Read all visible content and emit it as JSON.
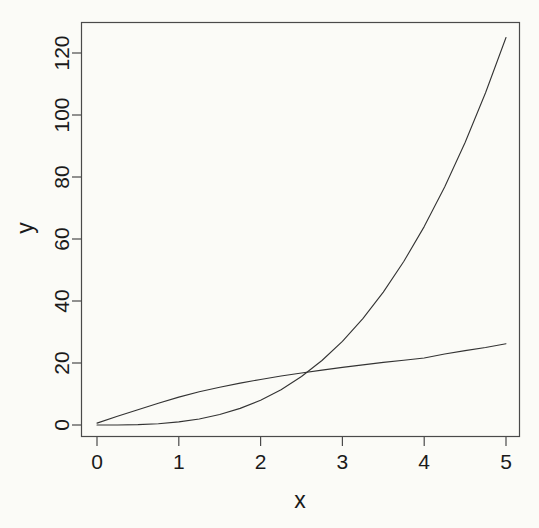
{
  "chart_data": {
    "type": "line",
    "title": "",
    "subtitle": "",
    "xlabel": "x",
    "ylabel": "y",
    "xlim": [
      0,
      5
    ],
    "ylim": [
      0,
      125
    ],
    "grid": false,
    "legend": null,
    "x_ticks": [
      "0",
      "1",
      "2",
      "3",
      "4",
      "5"
    ],
    "x_tick_values": [
      0,
      1,
      2,
      3,
      4,
      5
    ],
    "y_ticks": [
      "0",
      "20",
      "40",
      "60",
      "80",
      "100",
      "120"
    ],
    "y_tick_values": [
      0,
      20,
      40,
      60,
      80,
      100,
      120
    ],
    "x": [
      0,
      0.25,
      0.5,
      0.75,
      1,
      1.25,
      1.5,
      1.75,
      2,
      2.25,
      2.5,
      2.75,
      3,
      3.25,
      3.5,
      3.75,
      4,
      4.25,
      4.5,
      4.75,
      5
    ],
    "series": [
      {
        "name": "cubic",
        "color": "#333333",
        "linewidth": 1.1,
        "values": [
          0,
          0.02,
          0.13,
          0.42,
          1,
          1.95,
          3.38,
          5.36,
          8,
          11.39,
          15.63,
          20.8,
          27,
          34.33,
          42.88,
          52.73,
          64,
          76.77,
          91.13,
          107.17,
          125
        ]
      },
      {
        "name": "slow-growth",
        "color": "#333333",
        "linewidth": 1.1,
        "values": [
          0.6,
          2.8,
          4.9,
          7.0,
          9.0,
          10.7,
          12.2,
          13.5,
          14.7,
          15.8,
          16.8,
          17.7,
          18.6,
          19.4,
          20.2,
          20.9,
          21.6,
          22.9,
          24.0,
          25.0,
          26.2
        ]
      }
    ],
    "crossing_point": {
      "x": 2.33,
      "y": 12.9
    },
    "axis_color": "#444444",
    "background_color": "#fbfbf7"
  },
  "plot_geometry": {
    "box_left": 81,
    "box_right": 520,
    "box_top": 22,
    "box_bottom": 437,
    "x_pixel_at_0": 97,
    "x_pixel_at_5": 506,
    "y_pixel_at_0": 425,
    "y_pixel_at_120": 53
  }
}
